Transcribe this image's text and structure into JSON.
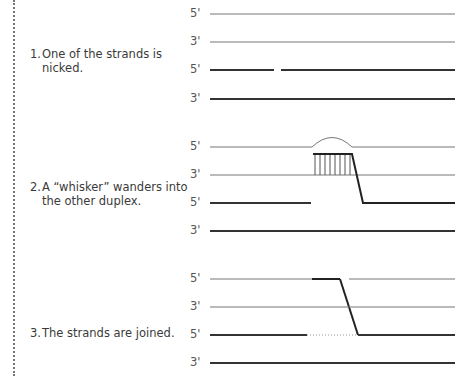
{
  "steps": [
    {
      "number": "1.",
      "line1": "One of the strands is",
      "line2": "nicked."
    },
    {
      "number": "2.",
      "line1": "A “whisker” wanders into",
      "line2": "the other duplex."
    },
    {
      "number": "3.",
      "line1": "The strands are joined.",
      "line2": ""
    }
  ],
  "strand_labels": {
    "d1": [
      "5'",
      "3'",
      "5'",
      "3'"
    ],
    "d2": [
      "5'",
      "3'",
      "5'",
      "3'"
    ],
    "d3": [
      "5'",
      "3'",
      "5'",
      "3'"
    ]
  },
  "colors": {
    "thin": "#777777",
    "thick": "#333333",
    "hatch": "#555555"
  }
}
